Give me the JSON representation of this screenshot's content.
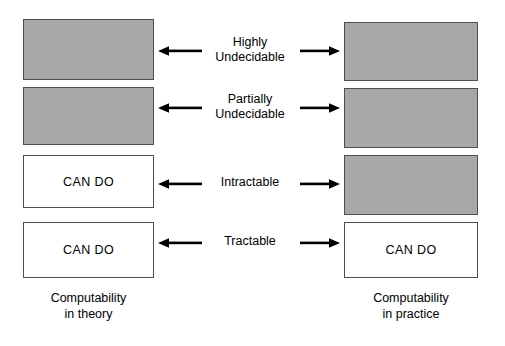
{
  "diagram": {
    "title_left": "Computability in theory",
    "title_right": "Computability in practice",
    "colors": {
      "shaded": "#a8a8a8",
      "unshaded": "#ffffff",
      "border": "#4f4f4f",
      "text": "#000000",
      "background": "#ffffff"
    },
    "can_do_text": "CAN DO",
    "rows": [
      {
        "label_line1": "Highly",
        "label_line2": "Undecidable",
        "left": {
          "fill": "shaded",
          "text": ""
        },
        "right": {
          "fill": "shaded",
          "text": ""
        },
        "left_arrow": "arrow-left-icon",
        "right_arrow": "arrow-right-icon"
      },
      {
        "label_line1": "Partially",
        "label_line2": "Undecidable",
        "left": {
          "fill": "shaded",
          "text": ""
        },
        "right": {
          "fill": "shaded",
          "text": ""
        },
        "left_arrow": "arrow-left-icon",
        "right_arrow": "arrow-right-icon"
      },
      {
        "label_line1": "Intractable",
        "label_line2": "",
        "left": {
          "fill": "unshaded",
          "text": "CAN DO"
        },
        "right": {
          "fill": "shaded",
          "text": ""
        },
        "left_arrow": "arrow-left-icon",
        "right_arrow": "arrow-right-icon"
      },
      {
        "label_line1": "Tractable",
        "label_line2": "",
        "left": {
          "fill": "unshaded",
          "text": "CAN DO"
        },
        "right": {
          "fill": "unshaded",
          "text": "CAN DO"
        },
        "left_arrow": "arrow-left-icon",
        "right_arrow": "arrow-right-icon"
      }
    ],
    "caption_left_line1": "Computability",
    "caption_left_line2": "in theory",
    "caption_right_line1": "Computability",
    "caption_right_line2": "in practice"
  }
}
